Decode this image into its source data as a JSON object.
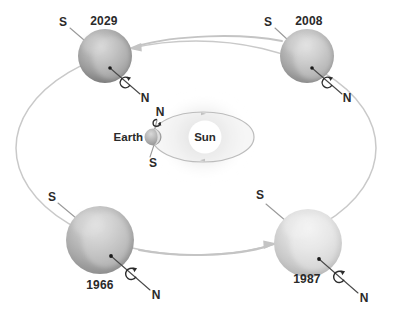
{
  "diagram": {
    "background_color": "#ffffff",
    "orbit_stroke_color": "#c9c9c9",
    "arrow_color": "#c4c4c4",
    "label_color": "#2a2a2a"
  },
  "center": {
    "sun_label": "Sun",
    "earth_label": "Earth",
    "earth_north_label": "N",
    "earth_south_label": "S",
    "sun_color": "#ffffff",
    "sun_glow_color": "#d8d8d8",
    "earth_color": "#b4b4b4"
  },
  "planets": [
    {
      "id": "planet-2029",
      "year": "2029",
      "north_label": "N",
      "south_label": "S",
      "position": "top-left",
      "cx": 105,
      "cy": 56,
      "r": 27,
      "tone": "dark",
      "base_color": "#9d9d9d"
    },
    {
      "id": "planet-2008",
      "year": "2008",
      "north_label": "N",
      "south_label": "S",
      "position": "top-right",
      "cx": 307,
      "cy": 56,
      "r": 27,
      "tone": "medium",
      "base_color": "#a8a8a8"
    },
    {
      "id": "planet-1966",
      "year": "1966",
      "north_label": "N",
      "south_label": "S",
      "position": "bottom-left",
      "cx": 100,
      "cy": 240,
      "r": 34,
      "tone": "medium-dark",
      "base_color": "#a4a4a4"
    },
    {
      "id": "planet-1987",
      "year": "1987",
      "north_label": "N",
      "south_label": "S",
      "position": "bottom-right",
      "cx": 308,
      "cy": 243,
      "r": 34,
      "tone": "light",
      "base_color": "#cfcfcf"
    }
  ],
  "motion_arrows": [
    {
      "id": "arrow-top",
      "direction": "left",
      "from": "2008",
      "to": "2029"
    },
    {
      "id": "arrow-bottom",
      "direction": "right",
      "from": "1966",
      "to": "1987"
    }
  ]
}
